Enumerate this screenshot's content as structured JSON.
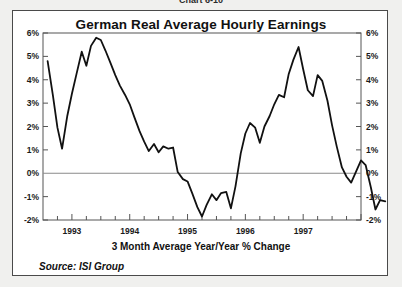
{
  "page": {
    "top_partial_label": "Chart 6-10"
  },
  "chart_data": {
    "type": "line",
    "title": "German Real Average Hourly Earnings",
    "subtitle": "3 Month Average Year/Year % Change",
    "source": "Source: ISI Group",
    "xlabel": "",
    "ylabel": "",
    "ylim": [
      -2,
      6
    ],
    "ytick_step": 1,
    "ytick_labels": [
      "6%",
      "5%",
      "4%",
      "3%",
      "2%",
      "1%",
      "0%",
      "-1%",
      "-2%"
    ],
    "ytick_values": [
      6,
      5,
      4,
      3,
      2,
      1,
      0,
      -1,
      -2
    ],
    "dual_axis": true,
    "grid": false,
    "zero_line": true,
    "legend": null,
    "xlim": [
      1992.5,
      1998.0
    ],
    "xtick_labels": [
      "1993",
      "1994",
      "1995",
      "1996",
      "1997"
    ],
    "xtick_values": [
      1993,
      1994,
      1995,
      1996,
      1997
    ],
    "minor_tick_interval_months": 3,
    "line_color": "#111111",
    "line_width": 1.8,
    "series": [
      {
        "name": "German Real Average Hourly Earnings",
        "x": [
          1992.58,
          1992.67,
          1992.75,
          1992.83,
          1992.92,
          1993.0,
          1993.08,
          1993.17,
          1993.25,
          1993.33,
          1993.42,
          1993.5,
          1993.58,
          1993.67,
          1993.75,
          1993.83,
          1993.92,
          1994.0,
          1994.08,
          1994.17,
          1994.25,
          1994.33,
          1994.42,
          1994.5,
          1994.58,
          1994.67,
          1994.75,
          1994.83,
          1994.92,
          1995.0,
          1995.08,
          1995.17,
          1995.25,
          1995.33,
          1995.42,
          1995.5,
          1995.58,
          1995.67,
          1995.75,
          1995.83,
          1995.92,
          1996.0,
          1996.08,
          1996.17,
          1996.25,
          1996.33,
          1996.42,
          1996.5,
          1996.58,
          1996.67,
          1996.75,
          1996.83,
          1996.92,
          1997.0,
          1997.08,
          1997.17,
          1997.25,
          1997.33,
          1997.42,
          1997.5,
          1997.58,
          1997.67,
          1997.75,
          1997.83
        ],
        "y": [
          4.8,
          3.35,
          1.95,
          1.05,
          2.45,
          3.4,
          4.25,
          5.2,
          4.6,
          5.45,
          5.8,
          5.7,
          5.25,
          4.7,
          4.2,
          3.75,
          3.35,
          2.95,
          2.4,
          1.8,
          1.35,
          0.95,
          1.25,
          0.9,
          1.15,
          1.05,
          1.1,
          0.05,
          -0.25,
          -0.35,
          -0.85,
          -1.45,
          -1.85,
          -1.35,
          -0.9,
          -1.15,
          -0.85,
          -0.8,
          -1.5,
          -0.55,
          0.85,
          1.7,
          2.15,
          1.95,
          1.3,
          2.0,
          2.45,
          2.95,
          3.35,
          3.25,
          4.25,
          4.85,
          5.4,
          4.45,
          3.55,
          3.3,
          4.2,
          3.95,
          3.1,
          2.05,
          1.15,
          0.25,
          -0.15,
          -0.4
        ]
      }
    ],
    "tail": {
      "x": [
        1997.83,
        1997.92,
        1998.0,
        1998.08,
        1998.17,
        1998.25,
        1998.33,
        1998.42
      ],
      "y": [
        -0.4,
        0.1,
        0.55,
        0.35,
        -0.6,
        -1.55,
        -1.15,
        -1.2
      ]
    },
    "annotations": []
  }
}
